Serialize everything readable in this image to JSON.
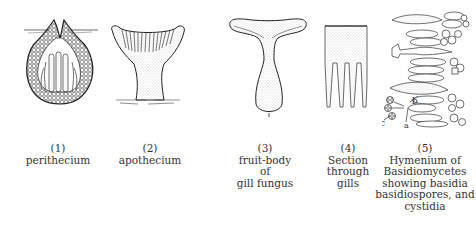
{
  "figure": {
    "panels": [
      {
        "number": "(1)",
        "lines": [
          "perithecium"
        ]
      },
      {
        "number": "(2)",
        "lines": [
          "apothecium"
        ]
      },
      {
        "number": "(3)",
        "lines": [
          "fruit-body",
          "of",
          "gill fungus"
        ]
      },
      {
        "number": "(4)",
        "lines": [
          "Section",
          "through",
          "gills"
        ]
      },
      {
        "number": "(5)",
        "lines": [
          "Hymenium of",
          "Basidiomycetes",
          "showing basidia",
          "basidiospores, and",
          "cystidia"
        ]
      }
    ],
    "annotations": {
      "a": "a",
      "b": "b",
      "c": "c"
    }
  }
}
